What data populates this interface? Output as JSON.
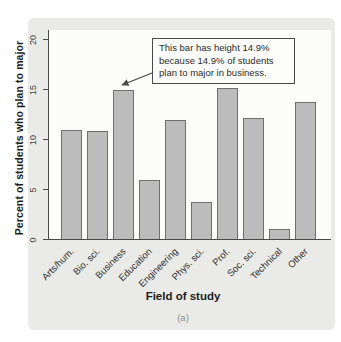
{
  "caption": "(a)",
  "annotation": {
    "text": "This bar has height 14.9%\nbecause 14.9% of students\nplan to major in business.",
    "target_category": "Business"
  },
  "chart_data": {
    "type": "bar",
    "title": "",
    "xlabel": "Field of study",
    "ylabel": "Percent of students who plan to major",
    "categories": [
      "Arts/hum.",
      "Bio. sci.",
      "Business",
      "Education",
      "Engineering",
      "Phys. sci.",
      "Prof.",
      "Soc. sci.",
      "Technical",
      "Other"
    ],
    "values": [
      10.9,
      10.8,
      14.9,
      5.9,
      11.9,
      3.7,
      15.1,
      12.1,
      1.0,
      13.7
    ],
    "ylim": [
      0,
      20
    ],
    "yticks": [
      0,
      5,
      10,
      15,
      20
    ],
    "grid": false,
    "legend": null,
    "annotated_bar": {
      "category": "Business",
      "value": 14.9
    },
    "colors": {
      "bar_fill": "#bcbcbc",
      "bar_border": "#6f6f6f",
      "axis": "#4a4a4a",
      "plot_bg": "#fcfcfa",
      "card_bg": "#eaeae8",
      "text": "#2b2b2b",
      "caption_text": "#8f8f8f"
    }
  }
}
